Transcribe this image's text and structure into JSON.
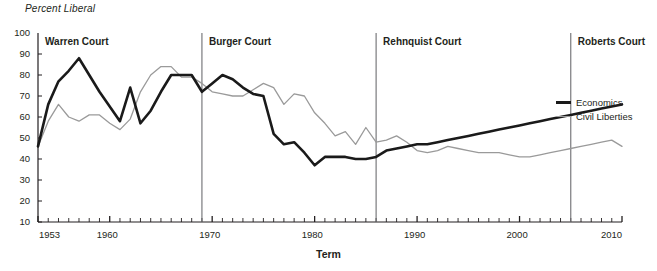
{
  "chart_data": {
    "type": "line",
    "title": "",
    "ylabel": "Percent Liberal",
    "xlabel": "Term",
    "ylim": [
      10,
      100
    ],
    "xlim": [
      1953,
      2010
    ],
    "grid": false,
    "legend_position": "right",
    "y_ticks": [
      100,
      90,
      80,
      70,
      60,
      50,
      40,
      30,
      20,
      10
    ],
    "x_ticks": [
      1953,
      1960,
      1970,
      1980,
      1990,
      2000,
      2010
    ],
    "x_tick_interval": 1,
    "x": [
      1953,
      1954,
      1955,
      1956,
      1957,
      1958,
      1959,
      1960,
      1961,
      1962,
      1963,
      1964,
      1965,
      1966,
      1967,
      1968,
      1969,
      1970,
      1971,
      1972,
      1973,
      1974,
      1975,
      1976,
      1977,
      1978,
      1979,
      1980,
      1981,
      1982,
      1983,
      1984,
      1985,
      1986,
      1987,
      1988,
      1989,
      1990,
      1991,
      1992,
      1993,
      1994,
      1995,
      1996,
      1997,
      1998,
      1999,
      2000,
      2001,
      2002,
      2003,
      2004,
      2005,
      2006,
      2007,
      2008,
      2009,
      2010
    ],
    "series": [
      {
        "name": "Economics",
        "color": "#1a1a1a",
        "width": 2.6,
        "values": [
          46,
          66,
          77,
          82,
          88,
          80,
          72,
          65,
          58,
          74,
          57,
          63,
          72,
          80,
          80,
          80,
          72,
          76,
          80,
          78,
          74,
          71,
          70,
          52,
          47,
          48,
          43,
          37,
          41,
          41,
          41,
          40,
          40,
          41,
          44,
          45,
          46,
          47,
          47,
          48,
          49,
          50,
          51,
          52,
          53,
          54,
          55,
          56,
          57,
          58,
          59,
          60,
          61,
          62,
          63,
          64,
          65,
          66
        ]
      },
      {
        "name": "Civil Liberties",
        "color": "#9a9a9a",
        "width": 1.3,
        "values": [
          46,
          58,
          66,
          60,
          58,
          61,
          61,
          57,
          54,
          59,
          72,
          80,
          84,
          84,
          79,
          79,
          76,
          72,
          71,
          70,
          70,
          73,
          76,
          74,
          66,
          71,
          70,
          62,
          57,
          51,
          53,
          47,
          55,
          48,
          49,
          51,
          48,
          44,
          43,
          44,
          46,
          45,
          44,
          43,
          43,
          43,
          42,
          41,
          41,
          42,
          43,
          44,
          45,
          46,
          47,
          48,
          49,
          46
        ]
      }
    ],
    "series_points": {
      "economics": [
        [
          1953,
          46
        ],
        [
          1954,
          66
        ],
        [
          1955,
          77
        ],
        [
          1956,
          82
        ],
        [
          1957,
          88
        ],
        [
          1958,
          80
        ],
        [
          1959,
          72
        ],
        [
          1960,
          65
        ],
        [
          1961,
          58
        ],
        [
          1962,
          74
        ],
        [
          1963,
          57
        ],
        [
          1964,
          63
        ],
        [
          1965,
          72
        ],
        [
          1966,
          80
        ],
        [
          1967,
          80
        ],
        [
          1968,
          80
        ],
        [
          1969,
          72
        ],
        [
          1970,
          76
        ],
        [
          1971,
          80
        ],
        [
          1972,
          78
        ],
        [
          1973,
          74
        ],
        [
          1974,
          71
        ],
        [
          1975,
          70
        ],
        [
          1976,
          52
        ],
        [
          1977,
          47
        ],
        [
          1978,
          48
        ],
        [
          1979,
          43
        ],
        [
          1980,
          37
        ],
        [
          1981,
          41
        ],
        [
          1982,
          41
        ],
        [
          1983,
          41
        ],
        [
          1984,
          40
        ],
        [
          1985,
          40
        ],
        [
          1986,
          41
        ],
        [
          1987,
          44
        ],
        [
          1988,
          45
        ],
        [
          1989,
          46
        ],
        [
          1990,
          47
        ],
        [
          1991,
          47
        ],
        [
          1992,
          48
        ],
        [
          1993,
          49
        ],
        [
          1994,
          50
        ],
        [
          1995,
          51
        ],
        [
          1996,
          52
        ],
        [
          1997,
          53
        ],
        [
          1998,
          54
        ],
        [
          1999,
          55
        ],
        [
          2000,
          56
        ],
        [
          2001,
          57
        ],
        [
          2002,
          58
        ],
        [
          2003,
          59
        ],
        [
          2004,
          60
        ],
        [
          2005,
          61
        ],
        [
          2006,
          62
        ],
        [
          2007,
          63
        ],
        [
          2008,
          64
        ],
        [
          2009,
          65
        ],
        [
          2010,
          66
        ]
      ],
      "civil_liberties": [
        [
          1953,
          46
        ],
        [
          1954,
          58
        ],
        [
          1955,
          66
        ],
        [
          1956,
          60
        ],
        [
          1957,
          58
        ],
        [
          1958,
          61
        ],
        [
          1959,
          61
        ],
        [
          1960,
          57
        ],
        [
          1961,
          54
        ],
        [
          1962,
          59
        ],
        [
          1963,
          72
        ],
        [
          1964,
          80
        ],
        [
          1965,
          84
        ],
        [
          1966,
          84
        ],
        [
          1967,
          79
        ],
        [
          1968,
          79
        ],
        [
          1969,
          76
        ],
        [
          1970,
          72
        ],
        [
          1971,
          71
        ],
        [
          1972,
          70
        ],
        [
          1973,
          70
        ],
        [
          1974,
          73
        ],
        [
          1975,
          76
        ],
        [
          1976,
          74
        ],
        [
          1977,
          66
        ],
        [
          1978,
          71
        ],
        [
          1979,
          70
        ],
        [
          1980,
          62
        ],
        [
          1981,
          57
        ],
        [
          1982,
          51
        ],
        [
          1983,
          53
        ],
        [
          1984,
          47
        ],
        [
          1985,
          55
        ],
        [
          1986,
          48
        ],
        [
          1987,
          49
        ],
        [
          1988,
          51
        ],
        [
          1989,
          48
        ],
        [
          1990,
          44
        ],
        [
          1991,
          43
        ],
        [
          1992,
          44
        ],
        [
          1993,
          46
        ],
        [
          1994,
          45
        ],
        [
          1995,
          44
        ],
        [
          1996,
          43
        ],
        [
          1997,
          43
        ],
        [
          1998,
          43
        ],
        [
          1999,
          42
        ],
        [
          2000,
          41
        ],
        [
          2001,
          41
        ],
        [
          2002,
          42
        ],
        [
          2003,
          43
        ],
        [
          2004,
          44
        ],
        [
          2005,
          45
        ],
        [
          2006,
          46
        ],
        [
          2007,
          47
        ],
        [
          2008,
          48
        ],
        [
          2009,
          49
        ],
        [
          2010,
          46
        ]
      ]
    },
    "eras": [
      {
        "label": "Warren Court",
        "start": 1953,
        "end": 1969,
        "divider_year": 1953
      },
      {
        "label": "Burger Court",
        "start": 1969,
        "end": 1986,
        "divider_year": 1969
      },
      {
        "label": "Rehnquist Court",
        "start": 1986,
        "end": 2005,
        "divider_year": 1986
      },
      {
        "label": "Roberts Court",
        "start": 2005,
        "end": 2010,
        "divider_year": 2005
      }
    ],
    "legend": [
      {
        "name": "Economics",
        "color": "#1a1a1a"
      },
      {
        "name": "Civil Liberties",
        "color": "#9a9a9a"
      }
    ]
  }
}
